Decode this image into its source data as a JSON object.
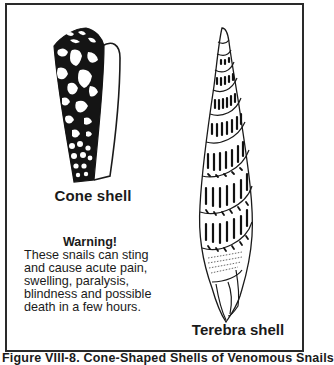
{
  "figure": {
    "caption": "Figure VIII-8. Cone-Shaped Shells of Venomous Snails",
    "colors": {
      "ink": "#1a1a1a",
      "background": "#ffffff",
      "frame": "#2a2a2a"
    }
  },
  "shells": [
    {
      "id": "cone",
      "label": "Cone shell",
      "pattern": "black shell with irregular white blotches, tapered cone, lip on right side"
    },
    {
      "id": "terebra",
      "label": "Terebra shell",
      "pattern": "tall spiral auger shell with banded dash markings on each whorl"
    }
  ],
  "warning": {
    "title": "Warning!",
    "lines": [
      "These snails can sting",
      "and cause acute pain,",
      "swelling, paralysis,",
      "blindness and possible",
      "death in a few hours."
    ],
    "body": "These snails can sting\nand cause acute pain,\nswelling, paralysis,\nblindness and possible\ndeath in a few hours."
  }
}
